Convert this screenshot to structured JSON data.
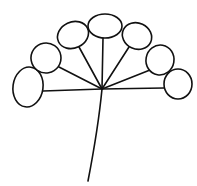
{
  "figure": {
    "width": 197,
    "height": 186,
    "background": "#ffffff",
    "stroke_color": "#111111",
    "stroke_width": 1.6,
    "hub": {
      "x": 102,
      "y": 89
    },
    "stem": {
      "path": "M102,89 C99,120 94,150 88,181"
    },
    "florets": [
      {
        "name": "floret-far-left",
        "cx": 28,
        "cy": 87,
        "rx": 15,
        "ry": 20,
        "rotate": 8,
        "attach": {
          "x": 43,
          "y": 91
        }
      },
      {
        "name": "floret-left-mid",
        "cx": 46,
        "cy": 58,
        "rx": 15,
        "ry": 15,
        "rotate": -10,
        "attach": {
          "x": 59,
          "y": 67
        }
      },
      {
        "name": "floret-left-top",
        "cx": 73,
        "cy": 35,
        "rx": 16,
        "ry": 13,
        "rotate": -25,
        "attach": {
          "x": 79,
          "y": 47
        }
      },
      {
        "name": "floret-top",
        "cx": 105,
        "cy": 26,
        "rx": 17,
        "ry": 12,
        "rotate": 0,
        "attach": {
          "x": 103,
          "y": 38
        }
      },
      {
        "name": "floret-right-top",
        "cx": 137,
        "cy": 36,
        "rx": 15,
        "ry": 13,
        "rotate": 25,
        "attach": {
          "x": 129,
          "y": 47
        }
      },
      {
        "name": "floret-right-mid",
        "cx": 160,
        "cy": 60,
        "rx": 14,
        "ry": 15,
        "rotate": 10,
        "attach": {
          "x": 150,
          "y": 70
        }
      },
      {
        "name": "floret-far-right",
        "cx": 178,
        "cy": 84,
        "rx": 14,
        "ry": 15,
        "rotate": 0,
        "attach": {
          "x": 164,
          "y": 88
        }
      }
    ]
  }
}
